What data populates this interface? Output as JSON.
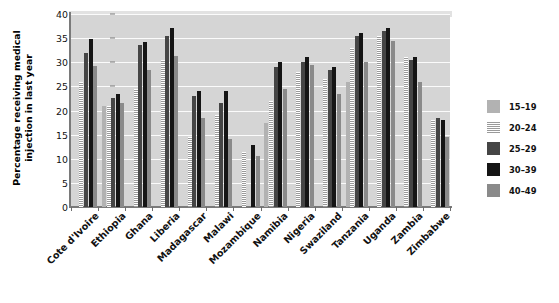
{
  "chart_data": {
    "type": "bar",
    "title": "",
    "xlabel": "",
    "ylabel": "Percentage receiving medical injection in last year",
    "ylabel_lines": [
      "Percentage receiving medical",
      "injection in last year"
    ],
    "ylim": [
      0,
      40
    ],
    "yticks": [
      0,
      5,
      10,
      15,
      20,
      25,
      30,
      35,
      40
    ],
    "grid": true,
    "legend_position": "right",
    "categories": [
      "Cote d'Ivoire",
      "Ethiopia",
      "Ghana",
      "Liberia",
      "Madagascar",
      "Malawi",
      "Mozambique",
      "Namibia",
      "Nigeria",
      "Swaziland",
      "Tanzania",
      "Uganda",
      "Zambia",
      "Zimbabwe"
    ],
    "series": [
      {
        "name": "15–19",
        "color": "#b2b2b2",
        "values": [
          null,
          21.0,
          null,
          null,
          null,
          null,
          null,
          17.5,
          null,
          null,
          26.0,
          null,
          null,
          null
        ]
      },
      {
        "name": "20–24",
        "color": "#efefef",
        "pattern": "horizontal-stripes",
        "values": [
          26.0,
          21.0,
          24.5,
          30.5,
          14.5,
          19.0,
          11.5,
          22.0,
          28.0,
          26.5,
          33.0,
          35.5,
          31.0,
          18.0
        ]
      },
      {
        "name": "25–29",
        "color": "#454545",
        "values": [
          32.0,
          22.5,
          33.5,
          35.5,
          23.0,
          21.5,
          null,
          29.0,
          30.0,
          28.5,
          35.5,
          36.5,
          30.5,
          18.5
        ]
      },
      {
        "name": "30–39",
        "color": "#151515",
        "values": [
          34.8,
          23.5,
          34.3,
          37.0,
          24.0,
          24.0,
          12.8,
          30.0,
          31.0,
          29.0,
          36.0,
          37.0,
          31.0,
          18.0
        ]
      },
      {
        "name": "40–49",
        "color": "#8a8a8a",
        "values": [
          29.2,
          21.5,
          28.3,
          31.2,
          18.5,
          14.2,
          10.5,
          24.5,
          29.5,
          23.5,
          30.0,
          34.5,
          26.0,
          14.5
        ]
      }
    ]
  },
  "legend": {
    "items": [
      {
        "label": "15–19",
        "swatch": "solid-light-gray"
      },
      {
        "label": "20–24",
        "swatch": "striped"
      },
      {
        "label": "25–29",
        "swatch": "solid-dark-gray"
      },
      {
        "label": "30–39",
        "swatch": "solid-black"
      },
      {
        "label": "40–49",
        "swatch": "solid-medium-gray"
      }
    ]
  }
}
